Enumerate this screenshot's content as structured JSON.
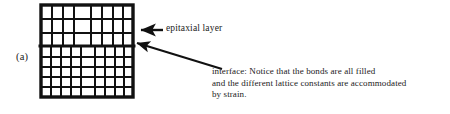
{
  "figure": {
    "panel_label": "(a)",
    "background_color": "#ffffff",
    "line_color": "#111111"
  },
  "annotations": {
    "epitaxial_layer_label": "epitaxial  layer",
    "interface_note_line1": "interface: Notice that the bonds are all filled",
    "interface_note_line2": "and the different lattice constants are accommodated",
    "interface_note_line3": "by strain."
  },
  "diagram_data": {
    "type": "lattice-schematic",
    "description": "Strained epitaxial layer grown on a substrate; top region has larger lattice constant cells, bottom region has smaller cells, joined at a coherent interface.",
    "lattice": {
      "left": 41,
      "right": 133,
      "top": 5,
      "bottom": 97,
      "interface_y": 46,
      "outer_border_width": 3.2,
      "inner_line_width": 2.0,
      "epitaxial_region": {
        "name": "epitaxial layer",
        "rows": 3,
        "columns": 7,
        "row_edges": [
          5,
          19,
          33,
          46
        ],
        "column_edges": [
          41,
          52,
          63,
          74,
          91,
          102,
          113,
          133
        ]
      },
      "substrate_region": {
        "name": "substrate",
        "rows": 5,
        "columns": 8,
        "row_edges": [
          46,
          57,
          67,
          77,
          87,
          97
        ],
        "column_edges": [
          41,
          51,
          61,
          71,
          81,
          95,
          105,
          115,
          133
        ]
      }
    },
    "arrows": [
      {
        "name": "epitaxial-layer-arrow",
        "style": "horizontal",
        "from_x": 163,
        "from_y": 30,
        "to_x": 139,
        "to_y": 30,
        "points_to": "epitaxial layer region of lattice"
      },
      {
        "name": "interface-arrow",
        "style": "diagonal",
        "from_x": 222,
        "from_y": 69,
        "to_x": 134,
        "to_y": 42,
        "points_to": "interface between epitaxial layer and substrate"
      }
    ]
  }
}
